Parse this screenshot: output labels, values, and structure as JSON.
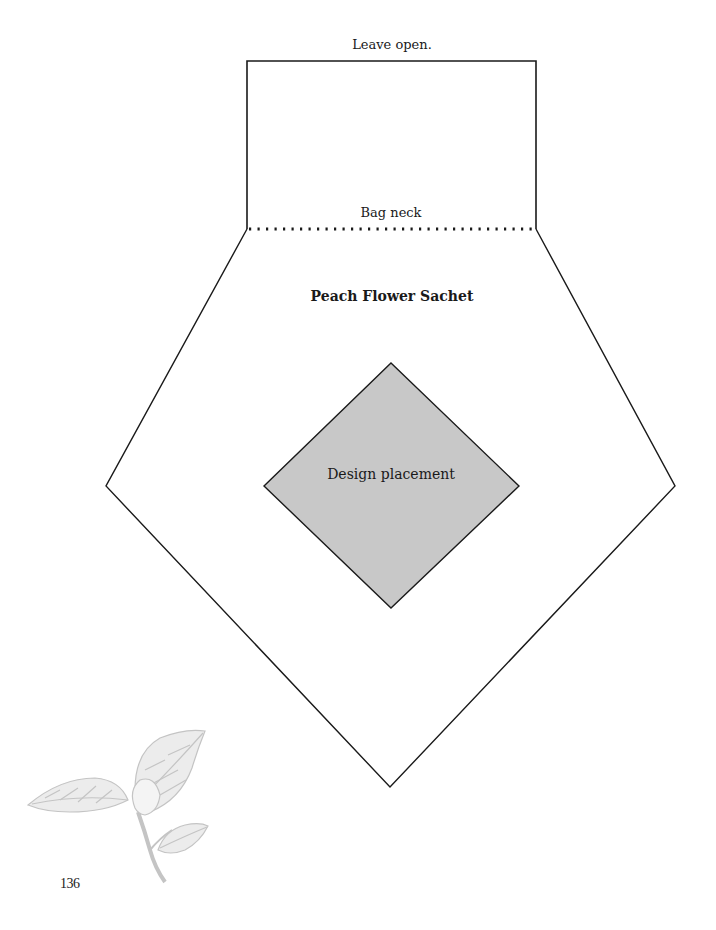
{
  "diagram": {
    "title": "Peach Flower Sachet",
    "top_label": "Leave open.",
    "neck_label": "Bag neck",
    "design_label": "Design placement",
    "page_number": "136",
    "colors": {
      "outline": "#1a1a1a",
      "design_fill": "#c8c8c8",
      "illustration": "#c4c4c4"
    },
    "decoration": "peach-blossom-branch-illustration"
  }
}
